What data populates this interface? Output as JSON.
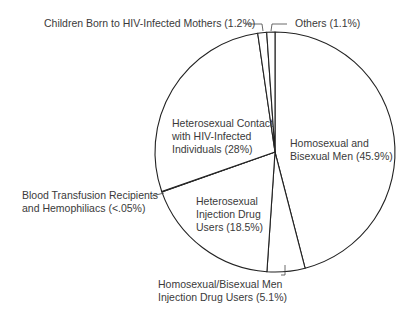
{
  "chart_data": {
    "type": "pie",
    "title": "",
    "slices": [
      {
        "label": "Homosexual and Bisexual Men",
        "value": 45.9,
        "display": "45.9%"
      },
      {
        "label": "Homosexual/Bisexual Men Injection Drug Users",
        "value": 5.1,
        "display": "5.1%"
      },
      {
        "label": "Heterosexual Injection Drug Users",
        "value": 18.5,
        "display": "18.5%"
      },
      {
        "label": "Blood Transfusion Recipients and Hemophiliacs",
        "value": 0.05,
        "display": "<.05%"
      },
      {
        "label": "Heterosexual Contact with HIV-Infected Individuals",
        "value": 28,
        "display": "28%"
      },
      {
        "label": "Children Born to HIV-Infected Mothers",
        "value": 1.2,
        "display": "1.2%"
      },
      {
        "label": "Others",
        "value": 1.1,
        "display": "1.1%"
      }
    ],
    "start_angle_deg": 0,
    "direction": "clockwise",
    "colors": {
      "fill": "#ffffff",
      "stroke": "#222222",
      "text": "#3a3a3a"
    }
  },
  "labels": {
    "children": "Children Born to HIV-Infected Mothers (1.2%)",
    "others": "Others (1.1%)",
    "het_contact_1": "Heterosexual Contact",
    "het_contact_2": "with HIV-Infected",
    "het_contact_3": "Individuals (28%)",
    "msm_1": "Homosexual and",
    "msm_2": "Bisexual Men (45.9%)",
    "blood_1": "Blood Transfusion Recipients",
    "blood_2": "and Hemophiliacs (<.05%)",
    "het_idu_1": "Heterosexual",
    "het_idu_2": "Injection Drug",
    "het_idu_3": "Users (18.5%)",
    "msm_idu_1": "Homosexual/Bisexual Men",
    "msm_idu_2": "Injection Drug Users (5.1%)"
  }
}
